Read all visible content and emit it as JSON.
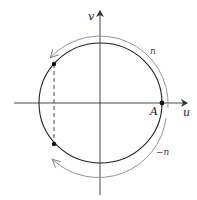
{
  "diagram": {
    "axes": {
      "horizontal_label": "u",
      "vertical_label": "v"
    },
    "point_label": "A",
    "arc_labels": {
      "upper": "n",
      "lower": "−n"
    },
    "colors": {
      "circle": "#222222",
      "axis": "#333333",
      "arc": "#888888",
      "point": "#111111"
    }
  }
}
